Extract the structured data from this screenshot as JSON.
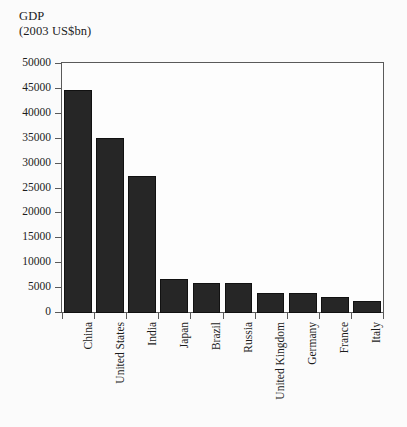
{
  "figure": {
    "title_lines": [
      "GDP",
      "(2003 US$bn)"
    ],
    "background_color": "#fbfbfb",
    "plot_background_color": "#fdfdfd",
    "bar_color": "#262626",
    "axis_color": "#5a5a5a",
    "text_color": "#1c1c1c"
  },
  "chart_data": {
    "type": "bar",
    "title": "GDP",
    "subtitle": "(2003 US$bn)",
    "xlabel": "",
    "ylabel": "GDP (2003 US$bn)",
    "categories": [
      "China",
      "United States",
      "India",
      "Japan",
      "Brazil",
      "Russia",
      "United Kingdom",
      "Germany",
      "France",
      "Italy"
    ],
    "values": [
      44800,
      35200,
      27500,
      6800,
      6100,
      6000,
      4000,
      3950,
      3300,
      2400
    ],
    "ylim": [
      0,
      50000
    ],
    "yticks": [
      0,
      5000,
      10000,
      15000,
      20000,
      25000,
      30000,
      35000,
      40000,
      45000,
      50000
    ],
    "ytick_labels": [
      "0",
      "5000",
      "10000",
      "15000",
      "20000",
      "25000",
      "30000",
      "35000",
      "40000",
      "45000",
      "50000"
    ],
    "grid": false,
    "legend": null,
    "legend_position": "none"
  }
}
